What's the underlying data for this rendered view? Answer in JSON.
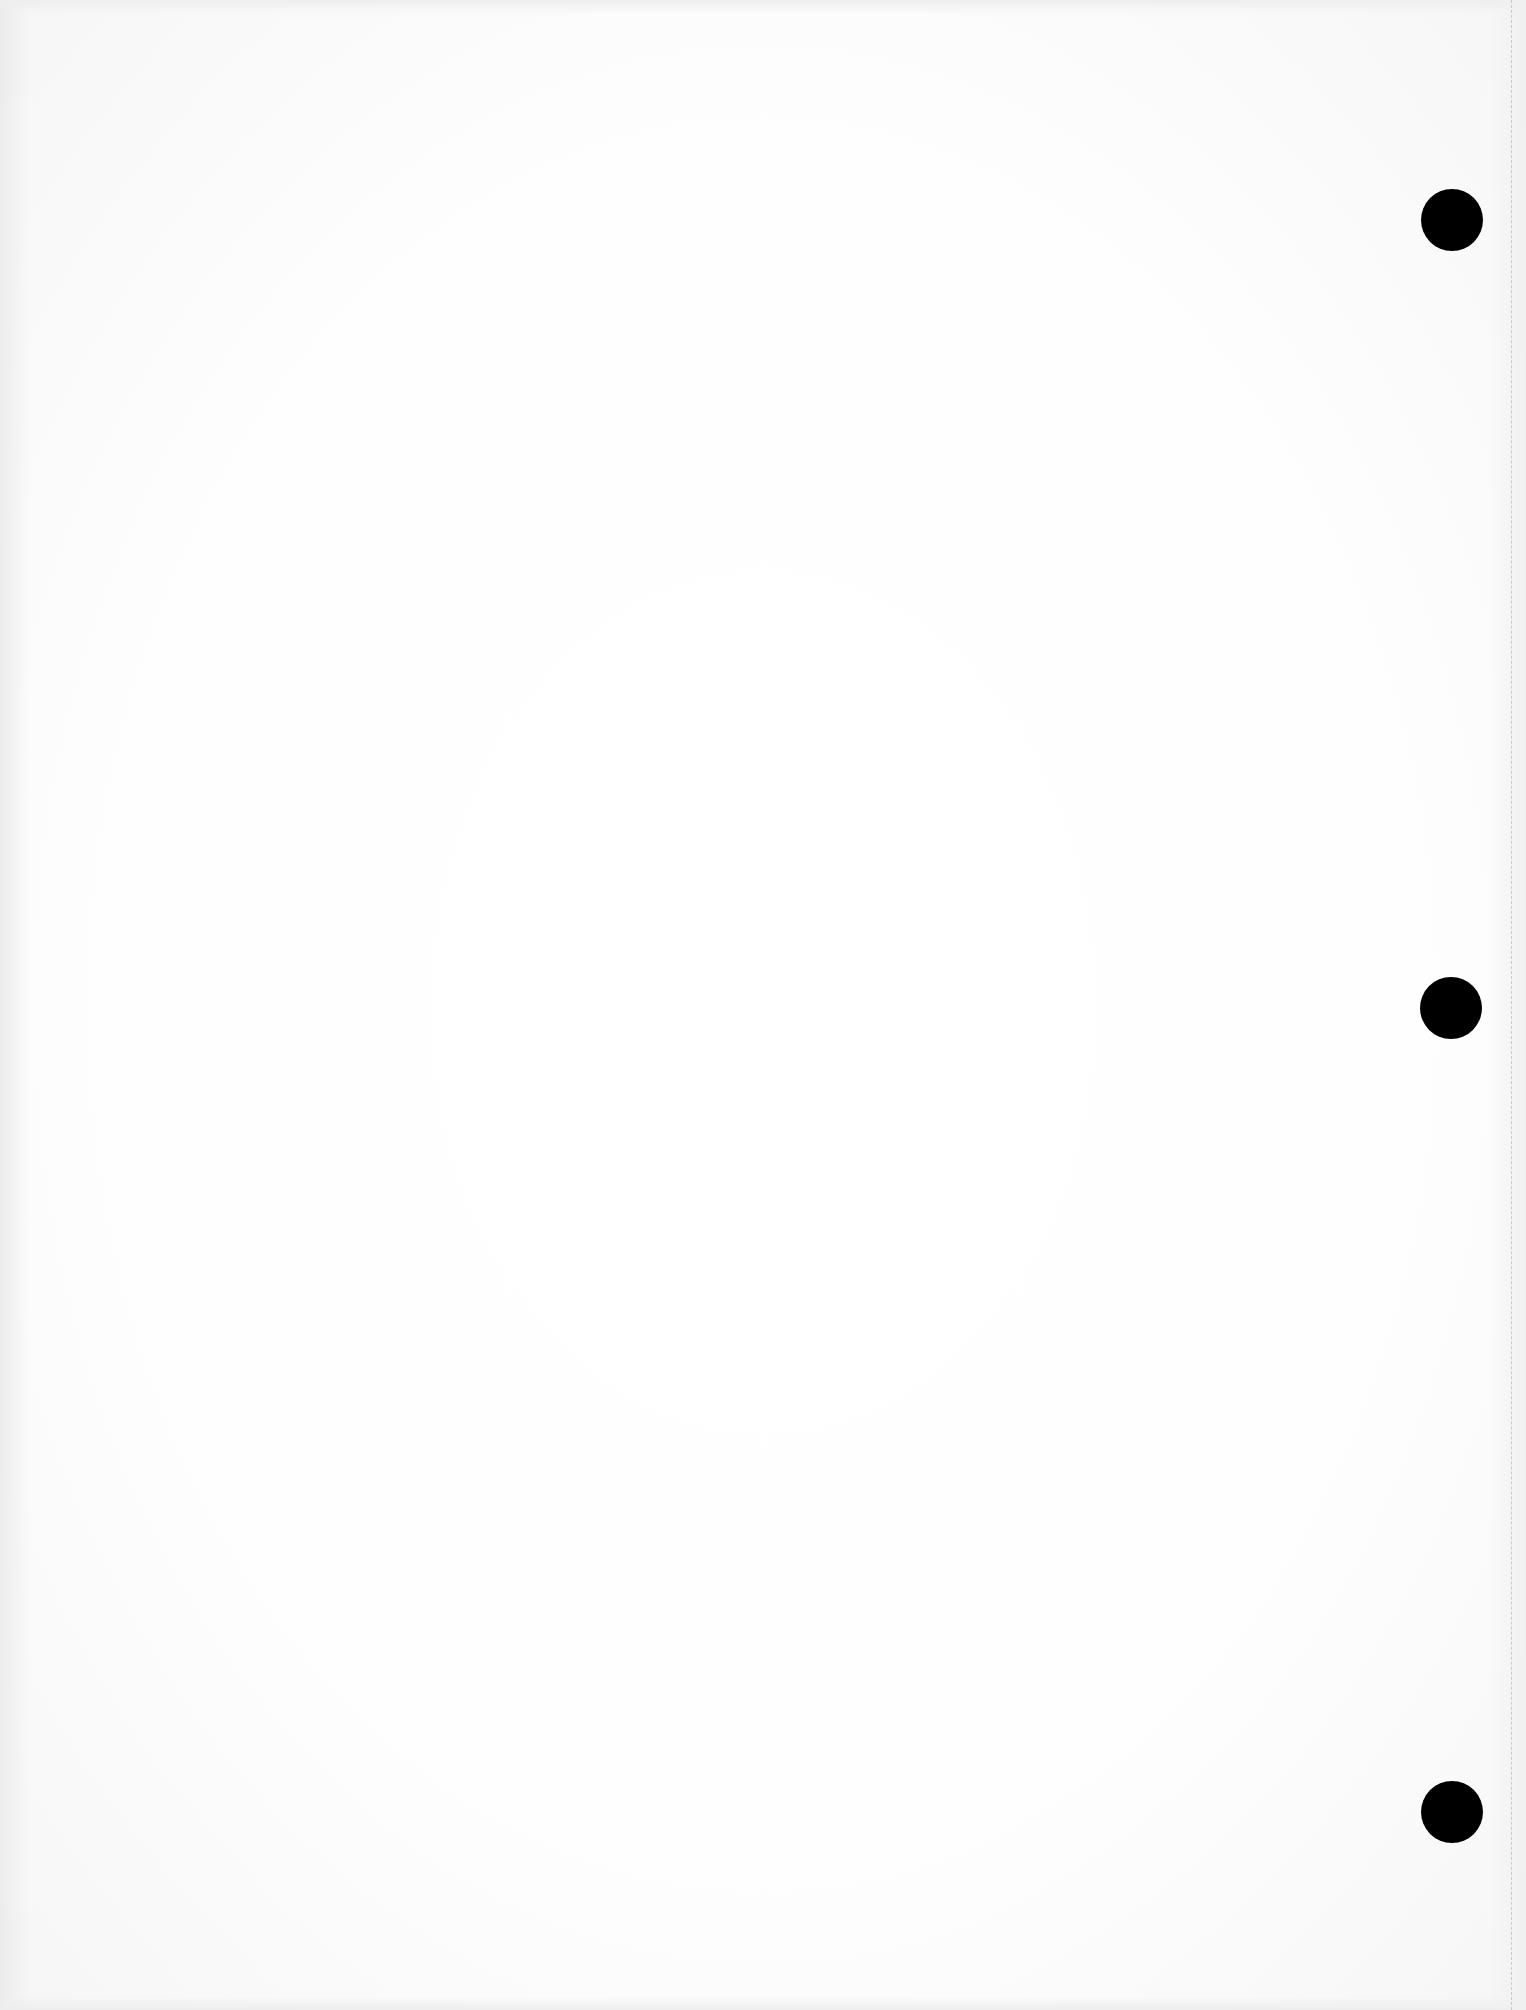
{
  "document": {
    "type": "blank-scanned-page",
    "text": "",
    "punch_holes": [
      {
        "cx": 1452,
        "cy": 220
      },
      {
        "cx": 1451,
        "cy": 1008
      },
      {
        "cx": 1452,
        "cy": 1812
      }
    ],
    "colors": {
      "paper": "#ffffff",
      "hole": "#000000",
      "perforation": "#c9c9c9"
    }
  }
}
